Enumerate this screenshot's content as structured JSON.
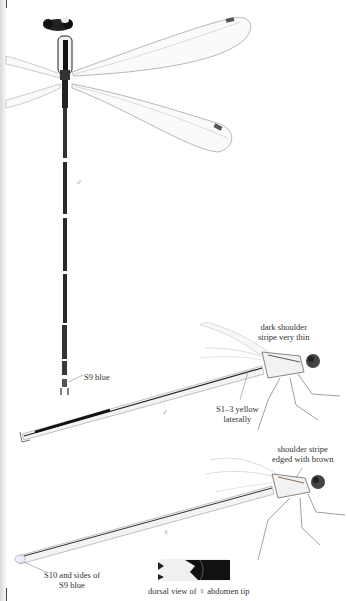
{
  "figures": {
    "male_dorsal": {
      "sex_symbol": "♂",
      "label_s9": "S9 blue"
    },
    "male_lateral": {
      "sex_symbol": "♂",
      "label_shoulder": [
        "dark shoulder",
        "stripe very thin"
      ],
      "label_s1_3": [
        "S1–3 yellow",
        "laterally"
      ]
    },
    "female_lateral": {
      "sex_symbol": "♀",
      "label_shoulder": [
        "shoulder stripe",
        "edged with brown"
      ],
      "label_s10": [
        "S10 and sides of",
        "S9 blue"
      ]
    },
    "abdomen_tip_inset": {
      "caption": "dorsal view of ♀ abdomen tip"
    }
  },
  "colors": {
    "body_dark": "#1a1a1a",
    "wing_vein": "#9a9a9a",
    "pterostigma": "#555555",
    "body_pale": "#e8ebe6",
    "gutter": "#dddddd"
  }
}
